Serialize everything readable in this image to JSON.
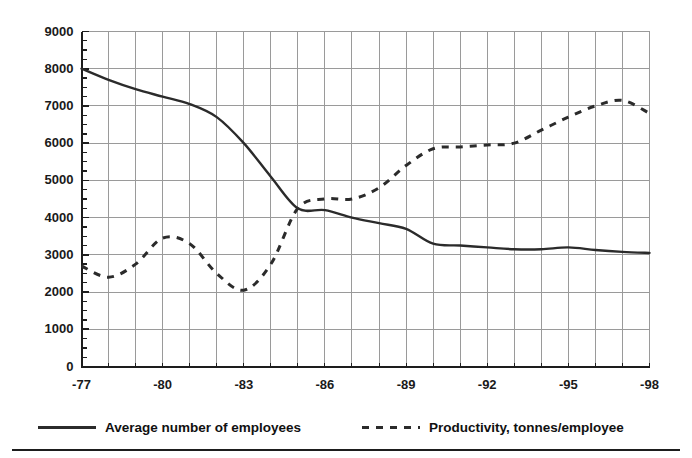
{
  "chart_data": {
    "type": "line",
    "title": "",
    "subtitle": "",
    "xlabel": "",
    "ylabel": "",
    "xlim": [
      -77,
      -98
    ],
    "ylim": [
      0,
      9000
    ],
    "grid": true,
    "legend_position": "bottom",
    "y_ticks": [
      0,
      1000,
      2000,
      3000,
      4000,
      5000,
      6000,
      7000,
      8000,
      9000
    ],
    "y_tick_labels": [
      "0",
      "1000",
      "2000",
      "3000",
      "4000",
      "5000",
      "6000",
      "7000",
      "8000",
      "9000"
    ],
    "y_minor_tick_step": 250,
    "x_ticks": [
      -77,
      -80,
      -83,
      -86,
      -89,
      -92,
      -95,
      -98
    ],
    "x_tick_labels": [
      "-77",
      "-80",
      "-83",
      "-86",
      "-89",
      "-92",
      "-95",
      "-98"
    ],
    "x": [
      -77,
      -78,
      -79,
      -80,
      -81,
      -82,
      -83,
      -84,
      -85,
      -86,
      -87,
      -88,
      -89,
      -90,
      -91,
      -92,
      -93,
      -94,
      -95,
      -96,
      -97,
      -98
    ],
    "series": [
      {
        "name": "Average number of employees",
        "style": "solid",
        "color": "#2b2b2b",
        "values": [
          8000,
          7700,
          7450,
          7250,
          7050,
          6700,
          6000,
          5100,
          4250,
          4200,
          4000,
          3850,
          3700,
          3300,
          3250,
          3200,
          3150,
          3150,
          3200,
          3130,
          3080,
          3050
        ]
      },
      {
        "name": "Productivity, tonnes/employee",
        "style": "dashed",
        "color": "#2b2b2b",
        "values": [
          2700,
          2400,
          2750,
          3450,
          3300,
          2500,
          2050,
          2750,
          4250,
          4500,
          4500,
          4800,
          5400,
          5850,
          5900,
          5950,
          6000,
          6350,
          6700,
          7000,
          7150,
          6800
        ]
      }
    ]
  },
  "legend": {
    "entries": [
      {
        "label": "Average number of employees",
        "style": "solid"
      },
      {
        "label": "Productivity, tonnes/employee",
        "style": "dashed"
      }
    ]
  }
}
